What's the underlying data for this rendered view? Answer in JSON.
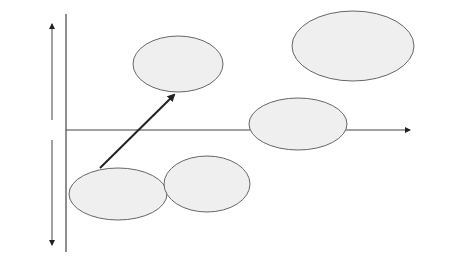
{
  "axis": {
    "proactive_label": "Pro -\nactive",
    "reactive_label": "Re -\nactive",
    "time_label": "Time"
  },
  "nodes": [
    {
      "id": "reorganising",
      "label": "Re-organising\nthe supply chains"
    },
    {
      "id": "localised",
      "label": "Localised\nmanufacturing\nclusters"
    },
    {
      "id": "highend",
      "label": "High end,\nworld class\nmanufacturing"
    },
    {
      "id": "eco",
      "label": "Eco-sustainable\nmanufacturing"
    },
    {
      "id": "firm",
      "label": "Firm innovation\nsystem competition on\nlead markets and social\nsystems innovation"
    }
  ],
  "edges": [
    {
      "from": "reorganising",
      "to": "highend"
    },
    {
      "from": "reorganising",
      "to": "localised"
    },
    {
      "from": "localised",
      "to": "eco"
    },
    {
      "from": "highend",
      "to": "eco"
    },
    {
      "from": "highend",
      "to": "firm"
    },
    {
      "from": "eco",
      "to": "firm",
      "bidirectional": true,
      "label": "?"
    },
    {
      "from": "firm",
      "to": "future",
      "label": "?"
    },
    {
      "from": "eco",
      "to": "future",
      "label": "?"
    }
  ],
  "question_marks": {
    "firm_out": "?",
    "eco_out": "?",
    "eco_firm": "?"
  }
}
